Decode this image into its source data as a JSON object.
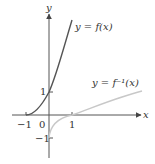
{
  "figure": {
    "axes": {
      "x_label": "x",
      "y_label": "y",
      "x_ticks": [
        {
          "value": -1,
          "label": "−1"
        },
        {
          "value": 1,
          "label": "1"
        }
      ],
      "y_ticks": [
        {
          "value": 1,
          "label": "1"
        },
        {
          "value": -1,
          "label": "−1"
        }
      ],
      "origin_label": "0"
    },
    "curves": [
      {
        "name": "f",
        "label": "y = f(x)",
        "color": "#555555"
      },
      {
        "name": "f_inverse",
        "label": "y = f⁻¹(x)",
        "color": "#c8c8c8"
      }
    ],
    "colors": {
      "axis": "#555555",
      "text": "#333333"
    }
  }
}
